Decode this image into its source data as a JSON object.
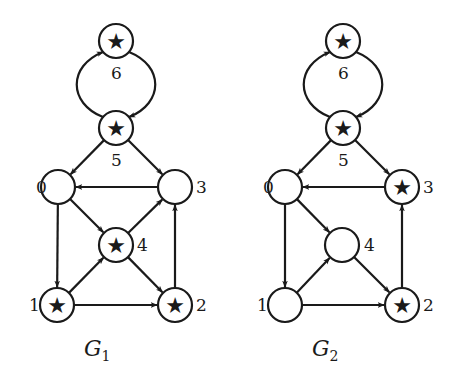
{
  "graphs": [
    {
      "id": "G1",
      "caption": {
        "main": "G",
        "sub": "1",
        "x": 84,
        "y": 356
      },
      "nodes": [
        {
          "id": "0",
          "x": 58,
          "y": 187,
          "star": false,
          "label": "0",
          "lx": 36,
          "ly": 193
        },
        {
          "id": "1",
          "x": 57,
          "y": 305,
          "star": true,
          "label": "1",
          "lx": 29,
          "ly": 311
        },
        {
          "id": "2",
          "x": 175,
          "y": 305,
          "star": true,
          "label": "2",
          "lx": 196,
          "ly": 311
        },
        {
          "id": "3",
          "x": 175,
          "y": 187,
          "star": false,
          "label": "3",
          "lx": 196,
          "ly": 193
        },
        {
          "id": "4",
          "x": 116,
          "y": 245,
          "star": true,
          "label": "4",
          "lx": 137,
          "ly": 251
        },
        {
          "id": "5",
          "x": 116,
          "y": 128,
          "star": true,
          "label": "5",
          "lx": 111,
          "ly": 166
        },
        {
          "id": "6",
          "x": 116,
          "y": 41,
          "star": true,
          "label": "6",
          "lx": 111,
          "ly": 79
        }
      ],
      "edges": [
        {
          "from": "6",
          "to": "5",
          "curve": "right"
        },
        {
          "from": "5",
          "to": "6",
          "curve": "left"
        },
        {
          "from": "5",
          "to": "0"
        },
        {
          "from": "5",
          "to": "3"
        },
        {
          "from": "3",
          "to": "0"
        },
        {
          "from": "0",
          "to": "1"
        },
        {
          "from": "0",
          "to": "4"
        },
        {
          "from": "1",
          "to": "4"
        },
        {
          "from": "4",
          "to": "3"
        },
        {
          "from": "4",
          "to": "2"
        },
        {
          "from": "1",
          "to": "2"
        },
        {
          "from": "2",
          "to": "3"
        }
      ]
    },
    {
      "id": "G2",
      "caption": {
        "main": "G",
        "sub": "2",
        "x": 312,
        "y": 356
      },
      "nodes": [
        {
          "id": "0",
          "x": 285,
          "y": 187,
          "star": false,
          "label": "0",
          "lx": 263,
          "ly": 193
        },
        {
          "id": "1",
          "x": 285,
          "y": 305,
          "star": false,
          "label": "1",
          "lx": 257,
          "ly": 311
        },
        {
          "id": "2",
          "x": 402,
          "y": 305,
          "star": true,
          "label": "2",
          "lx": 423,
          "ly": 311
        },
        {
          "id": "3",
          "x": 402,
          "y": 187,
          "star": true,
          "label": "3",
          "lx": 423,
          "ly": 193
        },
        {
          "id": "4",
          "x": 342,
          "y": 245,
          "star": false,
          "label": "4",
          "lx": 364,
          "ly": 251
        },
        {
          "id": "5",
          "x": 343,
          "y": 128,
          "star": true,
          "label": "5",
          "lx": 338,
          "ly": 166
        },
        {
          "id": "6",
          "x": 343,
          "y": 41,
          "star": true,
          "label": "6",
          "lx": 338,
          "ly": 79
        }
      ],
      "edges": [
        {
          "from": "6",
          "to": "5",
          "curve": "right"
        },
        {
          "from": "5",
          "to": "6",
          "curve": "left"
        },
        {
          "from": "5",
          "to": "0"
        },
        {
          "from": "5",
          "to": "3"
        },
        {
          "from": "3",
          "to": "0"
        },
        {
          "from": "0",
          "to": "1"
        },
        {
          "from": "0",
          "to": "4"
        },
        {
          "from": "1",
          "to": "4"
        },
        {
          "from": "4",
          "to": "2"
        },
        {
          "from": "1",
          "to": "2"
        },
        {
          "from": "2",
          "to": "3"
        }
      ]
    }
  ],
  "style": {
    "node_radius": 17,
    "star_glyph": "★",
    "stroke_color": "#1a1a1a",
    "background": "#ffffff"
  }
}
